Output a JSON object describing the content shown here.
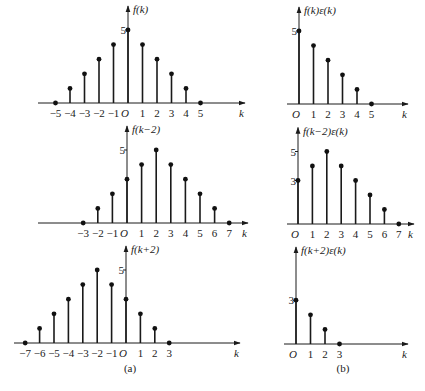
{
  "captions": {
    "a": "(a)",
    "b": "(b)"
  },
  "panels": [
    {
      "id": "a-top",
      "title": "f(k)",
      "origin": [
        128,
        103
      ],
      "xstep": 14.5,
      "ystep": 14.6,
      "xmin_px": 38,
      "xmax_px": 245,
      "ticks": [
        "-5",
        "-4",
        "-3",
        "-2",
        "-1",
        "O",
        "1",
        "2",
        "3",
        "4",
        "5"
      ],
      "tick_k": [
        -5,
        -4,
        -3,
        -2,
        -1,
        0,
        1,
        2,
        3,
        4,
        5
      ],
      "ylabels": [
        {
          "v": 5,
          "t": "5"
        }
      ],
      "k": [
        -5,
        -4,
        -3,
        -2,
        -1,
        0,
        1,
        2,
        3,
        4,
        5
      ],
      "v": [
        0,
        1,
        2,
        3,
        4,
        5,
        4,
        3,
        2,
        1,
        0
      ]
    },
    {
      "id": "b-top",
      "title": "f(k)ε(k)",
      "origin": [
        299,
        104
      ],
      "xstep": 14.5,
      "ystep": 14.6,
      "xmin_px": 287,
      "xmax_px": 408,
      "ticks": [
        "O",
        "1",
        "2",
        "3",
        "4",
        "5"
      ],
      "tick_k": [
        0,
        1,
        2,
        3,
        4,
        5
      ],
      "ylabels": [
        {
          "v": 5,
          "t": "5"
        }
      ],
      "k": [
        0,
        1,
        2,
        3,
        4,
        5
      ],
      "v": [
        5,
        4,
        3,
        2,
        1,
        0
      ]
    },
    {
      "id": "a-mid",
      "title": "f(k−2)",
      "origin": [
        127,
        223
      ],
      "xstep": 14.6,
      "ystep": 14.6,
      "xmin_px": 38,
      "xmax_px": 248,
      "ticks": [
        "-3",
        "-2",
        "-1",
        "O",
        "1",
        "2",
        "3",
        "4",
        "5",
        "6",
        "7"
      ],
      "tick_k": [
        -3,
        -2,
        -1,
        0,
        1,
        2,
        3,
        4,
        5,
        6,
        7
      ],
      "ylabels": [
        {
          "v": 5,
          "t": "5"
        }
      ],
      "k": [
        -3,
        -2,
        -1,
        0,
        1,
        2,
        3,
        4,
        5,
        6,
        7
      ],
      "v": [
        0,
        1,
        2,
        3,
        4,
        5,
        4,
        3,
        2,
        1,
        0
      ]
    },
    {
      "id": "b-mid",
      "title": "f(k−2)ε(k)",
      "origin": [
        298,
        224
      ],
      "xstep": 14.4,
      "ystep": 14.5,
      "xmin_px": 287,
      "xmax_px": 414,
      "ticks": [
        "O",
        "1",
        "2",
        "3",
        "4",
        "5",
        "6",
        "7"
      ],
      "tick_k": [
        0,
        1,
        2,
        3,
        4,
        5,
        6,
        7
      ],
      "ylabels": [
        {
          "v": 5,
          "t": "5"
        },
        {
          "v": 3,
          "t": "3"
        }
      ],
      "k": [
        0,
        1,
        2,
        3,
        4,
        5,
        6,
        7
      ],
      "v": [
        3,
        4,
        5,
        4,
        3,
        2,
        1,
        0
      ]
    },
    {
      "id": "a-bot",
      "title": "f(k+2)",
      "origin": [
        126,
        343
      ],
      "xstep": 14.4,
      "ystep": 14.6,
      "xmin_px": 14,
      "xmax_px": 240,
      "ticks": [
        "-7",
        "-6",
        "-5",
        "-4",
        "-3",
        "-2",
        "-1",
        "O",
        "1",
        "2",
        "3"
      ],
      "tick_k": [
        -7,
        -6,
        -5,
        -4,
        -3,
        -2,
        -1,
        0,
        1,
        2,
        3
      ],
      "ylabels": [
        {
          "v": 5,
          "t": "5"
        }
      ],
      "k": [
        -7,
        -6,
        -5,
        -4,
        -3,
        -2,
        -1,
        0,
        1,
        2,
        3
      ],
      "v": [
        0,
        1,
        2,
        3,
        4,
        5,
        4,
        3,
        2,
        1,
        0
      ]
    },
    {
      "id": "b-bot",
      "title": "f(k+2)ε(k)",
      "origin": [
        296,
        344
      ],
      "xstep": 14.5,
      "ystep": 14.6,
      "xmin_px": 284,
      "xmax_px": 408,
      "ticks": [
        "O",
        "1",
        "2",
        "3"
      ],
      "tick_k": [
        0,
        1,
        2,
        3
      ],
      "ylabels": [
        {
          "v": 3,
          "t": "3"
        }
      ],
      "k": [
        0,
        1,
        2,
        3
      ],
      "v": [
        3,
        2,
        1,
        0
      ]
    }
  ],
  "axis_label": "k",
  "chart_data": [
    {
      "type": "stem",
      "title": "f(k)",
      "x": [
        -5,
        -4,
        -3,
        -2,
        -1,
        0,
        1,
        2,
        3,
        4,
        5
      ],
      "values": [
        0,
        1,
        2,
        3,
        4,
        5,
        4,
        3,
        2,
        1,
        0
      ],
      "xlabel": "k"
    },
    {
      "type": "stem",
      "title": "f(k)ε(k)",
      "x": [
        0,
        1,
        2,
        3,
        4,
        5
      ],
      "values": [
        5,
        4,
        3,
        2,
        1,
        0
      ],
      "xlabel": "k"
    },
    {
      "type": "stem",
      "title": "f(k−2)",
      "x": [
        -3,
        -2,
        -1,
        0,
        1,
        2,
        3,
        4,
        5,
        6,
        7
      ],
      "values": [
        0,
        1,
        2,
        3,
        4,
        5,
        4,
        3,
        2,
        1,
        0
      ],
      "xlabel": "k"
    },
    {
      "type": "stem",
      "title": "f(k−2)ε(k)",
      "x": [
        0,
        1,
        2,
        3,
        4,
        5,
        6,
        7
      ],
      "values": [
        3,
        4,
        5,
        4,
        3,
        2,
        1,
        0
      ],
      "xlabel": "k"
    },
    {
      "type": "stem",
      "title": "f(k+2)",
      "x": [
        -7,
        -6,
        -5,
        -4,
        -3,
        -2,
        -1,
        0,
        1,
        2,
        3
      ],
      "values": [
        0,
        1,
        2,
        3,
        4,
        5,
        4,
        3,
        2,
        1,
        0
      ],
      "xlabel": "k"
    },
    {
      "type": "stem",
      "title": "f(k+2)ε(k)",
      "x": [
        0,
        1,
        2,
        3
      ],
      "values": [
        3,
        2,
        1,
        0
      ],
      "xlabel": "k"
    }
  ]
}
